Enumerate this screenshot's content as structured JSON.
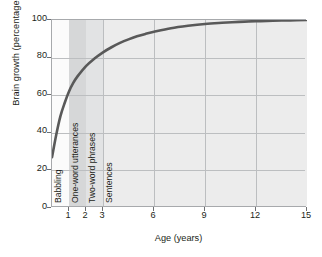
{
  "chart_data": {
    "type": "line",
    "title": "",
    "xlabel": "Age (years)",
    "ylabel": "Brain growth (percentage of adult size)",
    "xlim": [
      0,
      15
    ],
    "ylim": [
      0,
      100
    ],
    "xticks": [
      1,
      2,
      3,
      6,
      9,
      12,
      15
    ],
    "yticks": [
      0,
      20,
      40,
      60,
      80,
      100
    ],
    "xtick_labels": [
      "1",
      "2",
      "3",
      "6",
      "9",
      "12",
      "15"
    ],
    "ytick_labels": [
      "0",
      "20",
      "40",
      "60",
      "80",
      "100"
    ],
    "grid": true,
    "grid_x": [
      3,
      6,
      9,
      12
    ],
    "grid_y": [
      20,
      40,
      60,
      80
    ],
    "series": [
      {
        "name": "Brain growth",
        "color": "#595959",
        "x": [
          0.0,
          0.25,
          0.5,
          0.75,
          1.0,
          1.25,
          1.5,
          2.0,
          2.5,
          3.0,
          3.5,
          4.0,
          4.5,
          5.0,
          5.5,
          6.0,
          7.0,
          8.0,
          9.0,
          10.0,
          11.0,
          12.0,
          13.0,
          14.0,
          15.0
        ],
        "y": [
          27,
          39,
          49,
          56,
          62,
          66.5,
          70,
          75.5,
          79.5,
          82.8,
          85.5,
          87.8,
          89.7,
          91.3,
          92.6,
          93.7,
          95.6,
          96.9,
          97.9,
          98.5,
          99.0,
          99.4,
          99.6,
          99.8,
          100.0
        ]
      }
    ],
    "bands": [
      {
        "label": "Babbling",
        "x0": 0.0,
        "x1": 1.0,
        "color": "#fbfbfb"
      },
      {
        "label": "One-word utterances",
        "x0": 1.0,
        "x1": 2.0,
        "color": "#d6d7d8"
      },
      {
        "label": "Two-word phrases",
        "x0": 2.0,
        "x1": 3.0,
        "color": "#e2e3e4"
      },
      {
        "label": "Sentences",
        "x0": 3.0,
        "x1": 15.0,
        "color": "#ececec"
      }
    ],
    "band_labels": [
      "Babbling",
      "One-word utterances",
      "Two-word phrases",
      "Sentences"
    ],
    "colors": {
      "plot_background": "#f2f2f2",
      "grid": "#bcbec0",
      "axis": "#a7a9ac",
      "curve": "#595959",
      "text": "#231f20"
    }
  }
}
